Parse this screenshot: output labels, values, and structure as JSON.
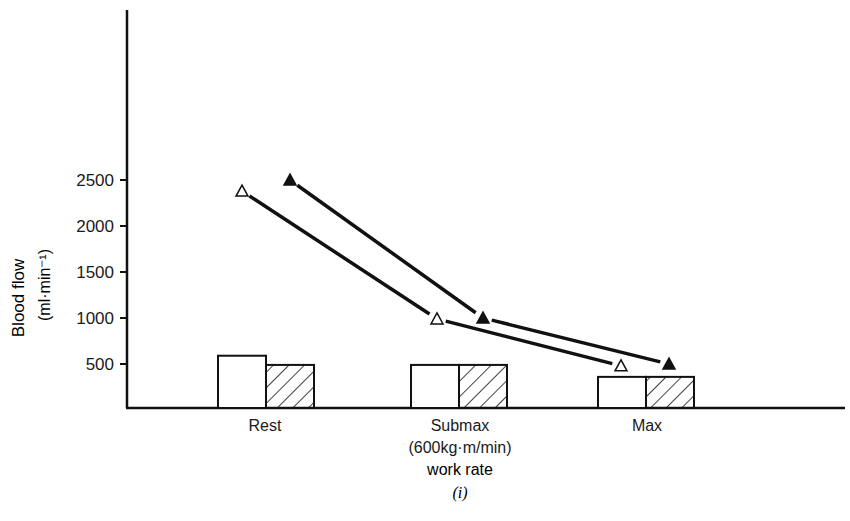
{
  "chart_data": {
    "type": "bar+line",
    "title": "",
    "xlabel": "work rate",
    "panel_label": "(i)",
    "ylabel": "Blood flow",
    "ylabel_units": "(ml·min⁻¹)",
    "ylim": [
      0,
      2500
    ],
    "yticks": [
      500,
      1000,
      1500,
      2000,
      2500
    ],
    "grid": false,
    "legend": "none",
    "categories": [
      "Rest",
      "Submax",
      "Max"
    ],
    "category_sublabels": [
      "",
      "(600kg·m/min)",
      ""
    ],
    "bars": [
      {
        "name": "open bar",
        "pattern": "open",
        "values": [
          590,
          490,
          360
        ]
      },
      {
        "name": "hatched bar",
        "pattern": "hatched",
        "values": [
          490,
          490,
          360
        ]
      }
    ],
    "series": [
      {
        "name": "open triangles",
        "marker": "open-triangle",
        "values": [
          2380,
          990,
          480
        ]
      },
      {
        "name": "filled triangles",
        "marker": "filled-triangle",
        "values": [
          2500,
          1000,
          500
        ]
      }
    ]
  }
}
